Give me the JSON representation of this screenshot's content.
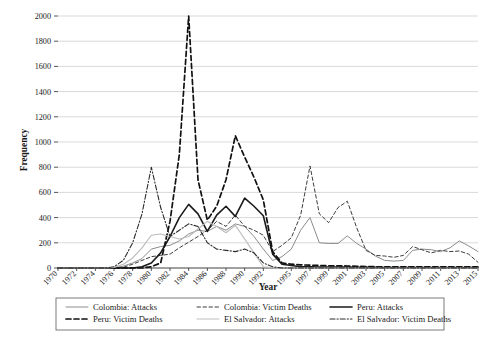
{
  "chart_data": {
    "type": "line",
    "title": "",
    "xlabel": "Year",
    "ylabel": "Frequency",
    "ylim": [
      0,
      2000
    ],
    "ytick_values": [
      0,
      200,
      400,
      600,
      800,
      1000,
      1200,
      1400,
      1600,
      1800,
      2000
    ],
    "ytick_labels": [
      "0",
      "200",
      "400",
      "600",
      "800",
      "1000",
      "1200",
      "1400",
      "1600",
      "1800",
      "2000"
    ],
    "grid": true,
    "legend_position": "bottom",
    "x": [
      1970,
      1971,
      1972,
      1973,
      1974,
      1975,
      1976,
      1977,
      1978,
      1979,
      1980,
      1981,
      1982,
      1983,
      1984,
      1985,
      1986,
      1987,
      1988,
      1989,
      1990,
      1991,
      1992,
      1993,
      1994,
      1995,
      1996,
      1997,
      1998,
      1999,
      2000,
      2001,
      2002,
      2003,
      2004,
      2005,
      2006,
      2007,
      2008,
      2009,
      2010,
      2011,
      2012,
      2013,
      2014,
      2015
    ],
    "xtick_labels": [
      "1970",
      "",
      "1972",
      "",
      "1974",
      "",
      "1976",
      "",
      "1978",
      "",
      "1980",
      "",
      "1982",
      "",
      "1984",
      "",
      "1986",
      "",
      "1988",
      "",
      "1990",
      "",
      "1992",
      "",
      "",
      "1995",
      "",
      "1997",
      "",
      "1999",
      "",
      "2001",
      "",
      "2003",
      "",
      "2005",
      "",
      "2007",
      "",
      "2009",
      "",
      "2011",
      "",
      "2013",
      "",
      "2015"
    ],
    "series": [
      {
        "name": "Colombia: Attacks",
        "style": "solid",
        "color": "#8c8c8c",
        "width": 1.0,
        "values": [
          0,
          0,
          0,
          0,
          0,
          0,
          2,
          15,
          40,
          75,
          150,
          170,
          180,
          215,
          270,
          300,
          290,
          330,
          300,
          350,
          330,
          250,
          150,
          60,
          90,
          150,
          300,
          400,
          200,
          195,
          195,
          255,
          195,
          150,
          95,
          60,
          55,
          60,
          140,
          150,
          145,
          130,
          160,
          215,
          175,
          130
        ]
      },
      {
        "name": "Colombia: Victim Deaths",
        "style": "dashed",
        "color": "#3d3d3d",
        "width": 1.0,
        "values": [
          0,
          0,
          0,
          0,
          0,
          0,
          0,
          5,
          30,
          60,
          90,
          100,
          110,
          160,
          205,
          250,
          300,
          370,
          330,
          420,
          330,
          300,
          260,
          130,
          180,
          240,
          420,
          810,
          430,
          360,
          480,
          530,
          320,
          140,
          100,
          95,
          85,
          100,
          170,
          145,
          120,
          140,
          130,
          135,
          110,
          45
        ]
      },
      {
        "name": "Peru: Attacks",
        "style": "solid",
        "color": "#1a1a1a",
        "width": 1.6,
        "values": [
          0,
          0,
          0,
          0,
          0,
          0,
          0,
          0,
          0,
          10,
          40,
          120,
          250,
          400,
          505,
          430,
          290,
          420,
          490,
          410,
          555,
          490,
          415,
          110,
          30,
          20,
          10,
          10,
          8,
          8,
          8,
          8,
          6,
          5,
          5,
          4,
          4,
          4,
          4,
          4,
          4,
          4,
          4,
          4,
          4,
          4
        ]
      },
      {
        "name": "Peru: Victim Deaths",
        "style": "dashed",
        "color": "#111111",
        "width": 1.7,
        "values": [
          0,
          0,
          0,
          0,
          0,
          0,
          0,
          0,
          0,
          0,
          10,
          40,
          370,
          900,
          2000,
          700,
          380,
          490,
          700,
          1050,
          880,
          720,
          540,
          130,
          40,
          30,
          25,
          22,
          20,
          18,
          18,
          16,
          14,
          12,
          10,
          10,
          10,
          10,
          10,
          10,
          10,
          10,
          10,
          10,
          10,
          10
        ]
      },
      {
        "name": "El Salvador: Attacks",
        "style": "solid",
        "color": "#bdbdbd",
        "width": 1.2,
        "values": [
          0,
          0,
          0,
          0,
          0,
          0,
          5,
          30,
          80,
          160,
          260,
          270,
          250,
          230,
          250,
          310,
          370,
          330,
          280,
          340,
          230,
          120,
          10,
          2,
          0,
          0,
          0,
          0,
          0,
          0,
          0,
          0,
          0,
          0,
          0,
          0,
          0,
          0,
          0,
          0,
          0,
          0,
          0,
          0,
          0,
          0
        ]
      },
      {
        "name": "El Salvador: Victim Deaths",
        "style": "dashdot",
        "color": "#2b2b2b",
        "width": 1.1,
        "values": [
          0,
          0,
          0,
          0,
          0,
          0,
          10,
          60,
          200,
          430,
          800,
          480,
          250,
          300,
          350,
          330,
          200,
          150,
          140,
          130,
          150,
          120,
          40,
          10,
          0,
          0,
          0,
          0,
          0,
          0,
          0,
          0,
          0,
          0,
          0,
          0,
          0,
          0,
          0,
          0,
          0,
          0,
          0,
          0,
          0,
          0
        ]
      }
    ]
  }
}
